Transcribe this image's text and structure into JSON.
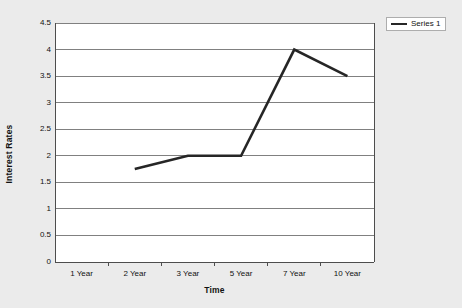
{
  "chart_data": {
    "type": "line",
    "title": "",
    "xlabel": "Time",
    "ylabel": "Interest Rates",
    "categories": [
      "1 Year",
      "2 Year",
      "3 Year",
      "5 Year",
      "7 Year",
      "10 Year"
    ],
    "series": [
      {
        "name": "Series 1",
        "values": [
          null,
          1.75,
          2,
          2,
          4,
          3.5
        ]
      }
    ],
    "ylim": [
      0,
      4.5
    ],
    "yticks": [
      0,
      0.5,
      1,
      1.5,
      2,
      2.5,
      3,
      3.5,
      4,
      4.5
    ],
    "ytick_labels": [
      "0",
      "0.5",
      "1",
      "1.5",
      "2",
      "2.5",
      "3",
      "3.5",
      "4",
      "4.5"
    ],
    "grid": true,
    "grid_axis": "y",
    "legend_position": "top-right",
    "colors": {
      "background": "#ebebeb",
      "plot_background": "#ffffff",
      "series_1": "#262626",
      "gridline": "#808080",
      "axis": "#4d4d4d",
      "text": "#111111"
    }
  },
  "legend": {
    "entries": [
      {
        "label": "Series 1",
        "marker": "line-swatch"
      }
    ]
  },
  "axes": {
    "y_title": "Interest Rates",
    "x_title": "Time"
  }
}
